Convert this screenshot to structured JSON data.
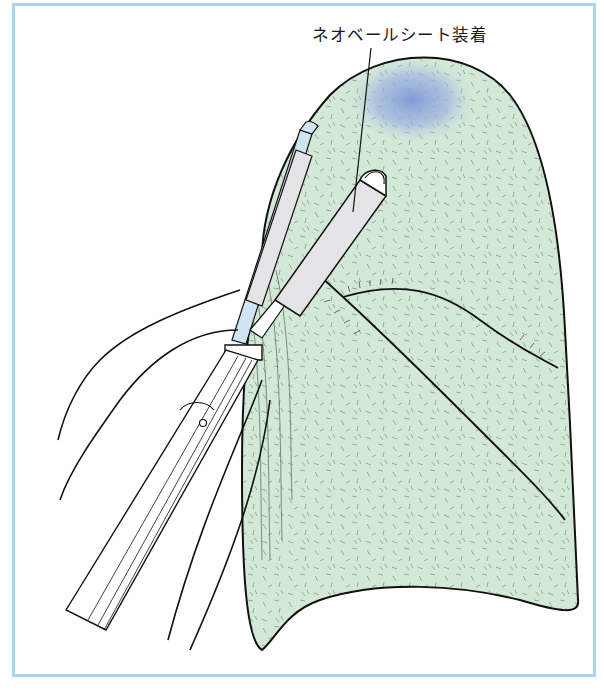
{
  "figure": {
    "annotation_label": "ネオベールシート装着",
    "colors": {
      "frame_border": "#a9d4ee",
      "lung_fill": "#d3e8d6",
      "lung_texture": "#6f8f7a",
      "lesion_highlight": "#8fa6dc",
      "instrument_sheath": "#e4e4e6",
      "instrument_tip_blue": "#cfe6f2",
      "outline": "#111111"
    },
    "elements": [
      "lung-lobe-illustration",
      "lesion-highlight",
      "fissure-lines",
      "sheet-applicator-instrument",
      "grasping-forceps-instrument",
      "thoracoscopic-port-shaft",
      "suture-threads"
    ]
  }
}
